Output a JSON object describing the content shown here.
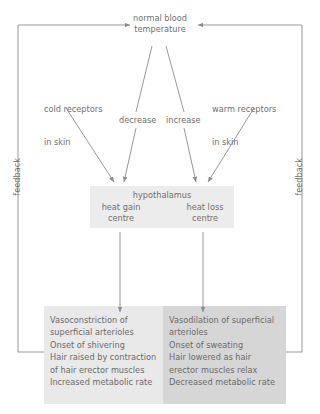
{
  "diagram": {
    "title_node": {
      "label": "normal blood\ntemperature",
      "line1": "normal blood",
      "line2": "temperature"
    },
    "receptors": {
      "cold": {
        "line1": "cold receptors",
        "line2": "in skin"
      },
      "warm": {
        "line1": "warm receptors",
        "line2": "in skin"
      }
    },
    "change_labels": {
      "decrease": "decrease",
      "increase": "increase"
    },
    "hypothalamus": {
      "title": "hypothalamus",
      "heat_gain": {
        "line1": "heat gain",
        "line2": "centre"
      },
      "heat_loss": {
        "line1": "heat loss",
        "line2": "centre"
      }
    },
    "feedback": {
      "left": "feedback",
      "right": "feedback"
    },
    "effects": {
      "heat_gain_box": {
        "lines": [
          "Vasoconstriction of",
          "superficial arterioles",
          "Onset of shivering",
          "Hair raised by contraction",
          "of hair erector muscles",
          "Increased metabolic rate"
        ]
      },
      "heat_loss_box": {
        "lines": [
          "Vasodilation of superficial",
          "arterioles",
          "Onset of sweating",
          "Hair lowered as hair",
          "erector muscles relax",
          "Decreased metabolic rate"
        ]
      }
    },
    "colors": {
      "line": "#8c8c8c",
      "text": "#6f6f6f",
      "box_left_fill": "#e9e9e9",
      "box_right_fill": "#d6d6d6",
      "hypothalamus_fill": "#ececec",
      "background": "#ffffff"
    }
  }
}
